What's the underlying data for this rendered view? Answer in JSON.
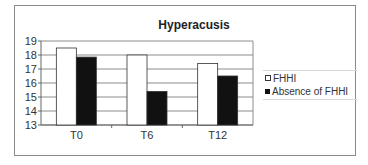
{
  "chart_data": {
    "type": "bar",
    "title": "Hyperacusis",
    "xlabel": "",
    "ylabel": "",
    "categories": [
      "T0",
      "T6",
      "T12"
    ],
    "series": [
      {
        "name": "FHHI",
        "values": [
          18.5,
          18.0,
          17.4
        ],
        "color": "#ffffff"
      },
      {
        "name": "Absence of FHHI",
        "values": [
          17.85,
          15.4,
          16.5
        ],
        "color": "#111111"
      }
    ],
    "ylim": [
      13,
      19
    ],
    "yticks": [
      13,
      14,
      15,
      16,
      17,
      18,
      19
    ],
    "grid": true,
    "legend_position": "right"
  },
  "legend": {
    "items": [
      {
        "label": "FHHI",
        "color": "#ffffff"
      },
      {
        "label": "Absence of FHHI",
        "color": "#111111"
      }
    ]
  }
}
